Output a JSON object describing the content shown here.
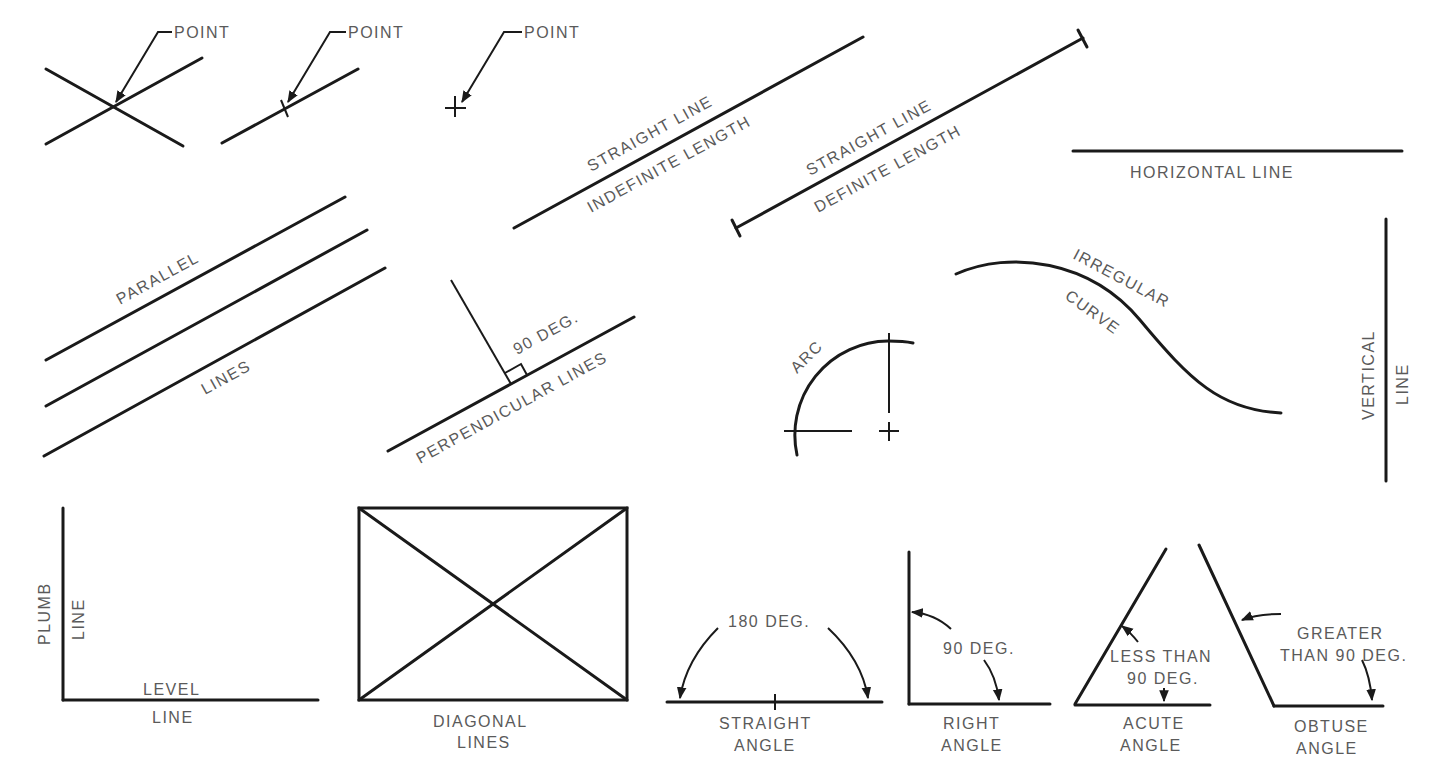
{
  "diagram": {
    "title_visible": false,
    "line_color": "#1a1a1a",
    "label_color": "#5a5a5a",
    "labels": {
      "point1": "POINT",
      "point2": "POINT",
      "point3": "POINT",
      "straight_indef_1": "STRAIGHT LINE",
      "straight_indef_2": "INDEFINITE LENGTH",
      "straight_def_1": "STRAIGHT LINE",
      "straight_def_2": "DEFINITE LENGTH",
      "horizontal": "HORIZONTAL LINE",
      "parallel_1": "PARALLEL",
      "parallel_2": "LINES",
      "perp_deg": "90 DEG.",
      "perp": "PERPENDICULAR LINES",
      "arc": "ARC",
      "irregular_1": "IRREGULAR",
      "irregular_2": "CURVE",
      "vertical_1": "VERTICAL",
      "vertical_2": "LINE",
      "plumb_1": "PLUMB",
      "plumb_2": "LINE",
      "level_1": "LEVEL",
      "level_2": "LINE",
      "diagonal_1": "DIAGONAL",
      "diagonal_2": "LINES",
      "straight_angle_deg": "180 DEG.",
      "straight_angle_1": "STRAIGHT",
      "straight_angle_2": "ANGLE",
      "right_angle_deg": "90 DEG.",
      "right_angle_1": "RIGHT",
      "right_angle_2": "ANGLE",
      "acute_deg_1": "LESS THAN",
      "acute_deg_2": "90 DEG.",
      "acute_1": "ACUTE",
      "acute_2": "ANGLE",
      "obtuse_deg_1": "GREATER",
      "obtuse_deg_2": "THAN 90 DEG.",
      "obtuse_1": "OBTUSE",
      "obtuse_2": "ANGLE"
    }
  }
}
